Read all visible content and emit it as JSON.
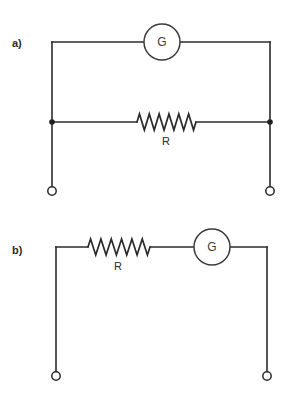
{
  "figure": {
    "background_color": "#ffffff",
    "line_color": "#2b2b2b",
    "width": 291,
    "height": 395
  },
  "panels": [
    {
      "id": "panel-a",
      "label": "a)",
      "label_x": 12,
      "label_y": 43,
      "topology": "parallel",
      "components": [
        {
          "kind": "galvanometer",
          "label": "G",
          "cx": 162,
          "cy": 42,
          "r": 18,
          "label_x": 162,
          "label_y": 42
        },
        {
          "kind": "resistor",
          "label": "R",
          "x1": 137,
          "x2": 196,
          "y": 122,
          "peaks": 6,
          "amplitude": 8,
          "label_x": 166,
          "label_y": 141
        }
      ],
      "nodes": [
        {
          "kind": "junction-dot",
          "cx": 52,
          "cy": 122,
          "r": 2.8
        },
        {
          "kind": "junction-dot",
          "cx": 270,
          "cy": 122,
          "r": 2.8
        }
      ],
      "terminals": [
        {
          "kind": "terminal",
          "cx": 52,
          "cy": 191,
          "r": 4.2
        },
        {
          "kind": "terminal",
          "cx": 270,
          "cy": 191,
          "r": 4.2
        }
      ],
      "wires": [
        {
          "name": "top-rail-left",
          "d": "M 52 42 L 144 42"
        },
        {
          "name": "top-rail-right",
          "d": "M 180 42 L 270 42"
        },
        {
          "name": "left-rail",
          "d": "M 52 42 L 52 187"
        },
        {
          "name": "right-rail",
          "d": "M 270 42 L 270 187"
        },
        {
          "name": "middle-rail-left",
          "d": "M 52 122 L 137 122"
        },
        {
          "name": "middle-rail-right",
          "d": "M 196 122 L 270 122"
        }
      ]
    },
    {
      "id": "panel-b",
      "label": "b)",
      "label_x": 12,
      "label_y": 250,
      "topology": "series",
      "components": [
        {
          "kind": "resistor",
          "label": "R",
          "x1": 88,
          "x2": 150,
          "y": 247,
          "peaks": 6,
          "amplitude": 8,
          "label_x": 118,
          "label_y": 266
        },
        {
          "kind": "galvanometer",
          "label": "G",
          "cx": 212,
          "cy": 247,
          "r": 18,
          "label_x": 212,
          "label_y": 247
        }
      ],
      "nodes": [],
      "terminals": [
        {
          "kind": "terminal",
          "cx": 56,
          "cy": 376,
          "r": 4.2
        },
        {
          "kind": "terminal",
          "cx": 267,
          "cy": 376,
          "r": 4.2
        }
      ],
      "wires": [
        {
          "name": "top-rail-left",
          "d": "M 56 247 L 88 247"
        },
        {
          "name": "top-rail-middle",
          "d": "M 150 247 L 194 247"
        },
        {
          "name": "top-rail-right",
          "d": "M 230 247 L 267 247"
        },
        {
          "name": "left-rail",
          "d": "M 56 247 L 56 372"
        },
        {
          "name": "right-rail",
          "d": "M 267 247 L 267 372"
        }
      ]
    }
  ]
}
